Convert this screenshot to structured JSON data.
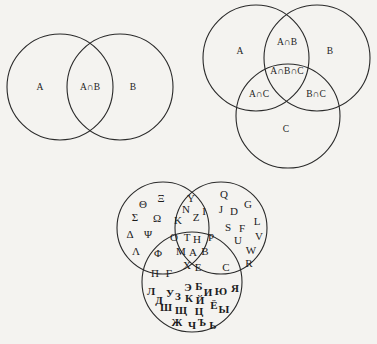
{
  "diagrams": {
    "two_set": {
      "circles": [
        {
          "name": "A",
          "cx": 60,
          "cy": 87,
          "r": 53
        },
        {
          "name": "B",
          "cx": 120,
          "cy": 87,
          "r": 53
        }
      ],
      "labels": [
        {
          "text": "A",
          "x": 40,
          "y": 88
        },
        {
          "text": "A∩B",
          "x": 90,
          "y": 88
        },
        {
          "text": "B",
          "x": 133,
          "y": 88
        }
      ]
    },
    "three_set": {
      "circles": [
        {
          "name": "A",
          "cx": 256,
          "cy": 58,
          "r": 53
        },
        {
          "name": "B",
          "cx": 317,
          "cy": 58,
          "r": 53
        },
        {
          "name": "C",
          "cx": 288,
          "cy": 116,
          "r": 52
        }
      ],
      "labels": [
        {
          "text": "A",
          "x": 240,
          "y": 52
        },
        {
          "text": "A∩B",
          "x": 287,
          "y": 43
        },
        {
          "text": "B",
          "x": 330,
          "y": 52
        },
        {
          "text": "A∩B∩C",
          "x": 287,
          "y": 72
        },
        {
          "text": "A∩C",
          "x": 259,
          "y": 95
        },
        {
          "text": "B∩C",
          "x": 316,
          "y": 95
        },
        {
          "text": "C",
          "x": 286,
          "y": 130
        }
      ]
    },
    "alphabets": {
      "circles": [
        {
          "name": "Greek",
          "cx": 163,
          "cy": 228,
          "r": 46
        },
        {
          "name": "Latin",
          "cx": 221,
          "cy": 228,
          "r": 46
        },
        {
          "name": "Cyrillic",
          "cx": 192,
          "cy": 282,
          "r": 50
        }
      ],
      "regions": {
        "greek_only": [
          {
            "t": "Θ",
            "x": 143,
            "y": 205
          },
          {
            "t": "Ξ",
            "x": 161,
            "y": 199
          },
          {
            "t": "Σ",
            "x": 135,
            "y": 218
          },
          {
            "t": "Ω",
            "x": 157,
            "y": 219
          },
          {
            "t": "Δ",
            "x": 130,
            "y": 235
          },
          {
            "t": "Ψ",
            "x": 148,
            "y": 235
          },
          {
            "t": "Λ",
            "x": 136,
            "y": 252
          }
        ],
        "greek_latin": [
          {
            "t": "Y",
            "x": 191,
            "y": 199
          },
          {
            "t": "N",
            "x": 186,
            "y": 210
          },
          {
            "t": "Z",
            "x": 196,
            "y": 218
          },
          {
            "t": "I",
            "x": 204,
            "y": 212
          },
          {
            "t": "K",
            "x": 178,
            "y": 221
          }
        ],
        "latin_only": [
          {
            "t": "Q",
            "x": 224,
            "y": 195
          },
          {
            "t": "G",
            "x": 248,
            "y": 205
          },
          {
            "t": "J",
            "x": 221,
            "y": 210
          },
          {
            "t": "D",
            "x": 234,
            "y": 212
          },
          {
            "t": "L",
            "x": 257,
            "y": 222
          },
          {
            "t": "S",
            "x": 228,
            "y": 228
          },
          {
            "t": "F",
            "x": 242,
            "y": 229
          },
          {
            "t": "V",
            "x": 259,
            "y": 237
          },
          {
            "t": "U",
            "x": 238,
            "y": 241
          },
          {
            "t": "W",
            "x": 251,
            "y": 251
          },
          {
            "t": "R",
            "x": 249,
            "y": 264
          }
        ],
        "all_three": [
          {
            "t": "O",
            "x": 174,
            "y": 238
          },
          {
            "t": "T",
            "x": 187,
            "y": 238
          },
          {
            "t": "H",
            "x": 197,
            "y": 240
          },
          {
            "t": "P",
            "x": 211,
            "y": 238
          },
          {
            "t": "M",
            "x": 181,
            "y": 252
          },
          {
            "t": "A",
            "x": 193,
            "y": 253
          },
          {
            "t": "B",
            "x": 205,
            "y": 252
          },
          {
            "t": "X",
            "x": 187,
            "y": 266
          },
          {
            "t": "E",
            "x": 198,
            "y": 268
          }
        ],
        "greek_cyrillic": [
          {
            "t": "Φ",
            "x": 158,
            "y": 254
          },
          {
            "t": "Π",
            "x": 155,
            "y": 274
          },
          {
            "t": "Γ",
            "x": 169,
            "y": 274
          }
        ],
        "latin_cyrillic": [
          {
            "t": "C",
            "x": 226,
            "y": 268
          }
        ],
        "cyrillic_only": [
          {
            "t": "Л",
            "x": 151,
            "y": 292
          },
          {
            "t": "Д",
            "x": 159,
            "y": 301
          },
          {
            "t": "У",
            "x": 170,
            "y": 294
          },
          {
            "t": "З",
            "x": 178,
            "y": 297
          },
          {
            "t": "Э",
            "x": 188,
            "y": 288
          },
          {
            "t": "Б",
            "x": 199,
            "y": 287
          },
          {
            "t": "И",
            "x": 208,
            "y": 293
          },
          {
            "t": "Ю",
            "x": 221,
            "y": 292
          },
          {
            "t": "Я",
            "x": 235,
            "y": 289
          },
          {
            "t": "К",
            "x": 189,
            "y": 299
          },
          {
            "t": "Й",
            "x": 200,
            "y": 301
          },
          {
            "t": "Ш",
            "x": 166,
            "y": 308
          },
          {
            "t": "Щ",
            "x": 181,
            "y": 311
          },
          {
            "t": "Ц",
            "x": 199,
            "y": 312
          },
          {
            "t": "Ё",
            "x": 214,
            "y": 306
          },
          {
            "t": "Ы",
            "x": 224,
            "y": 310
          },
          {
            "t": "Ж",
            "x": 177,
            "y": 323
          },
          {
            "t": "Ч",
            "x": 192,
            "y": 326
          },
          {
            "t": "Ъ",
            "x": 202,
            "y": 323
          },
          {
            "t": "Ь",
            "x": 213,
            "y": 326
          }
        ]
      }
    }
  },
  "colors": {
    "background": "#f4f3f0",
    "stroke": "#2a2a2a",
    "text": "#1c1c1c"
  }
}
